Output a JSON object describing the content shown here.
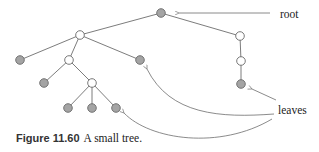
{
  "diagram": {
    "type": "tree",
    "colors": {
      "leaf_fill": "#a4a4a4",
      "internal_fill": "#ffffff",
      "line": "#6d6d6d"
    },
    "nodes": [
      {
        "id": "root",
        "kind": "leaf-colored",
        "role": "root"
      },
      {
        "id": "a",
        "kind": "internal"
      },
      {
        "id": "b",
        "kind": "internal"
      },
      {
        "id": "b2",
        "kind": "internal"
      },
      {
        "id": "b3",
        "kind": "leaf"
      },
      {
        "id": "l1",
        "kind": "leaf"
      },
      {
        "id": "c",
        "kind": "internal"
      },
      {
        "id": "l2",
        "kind": "leaf"
      },
      {
        "id": "l3",
        "kind": "leaf"
      },
      {
        "id": "d",
        "kind": "internal"
      },
      {
        "id": "l4",
        "kind": "leaf"
      },
      {
        "id": "l5",
        "kind": "leaf"
      },
      {
        "id": "l6",
        "kind": "leaf"
      }
    ],
    "edges": [
      [
        "root",
        "a"
      ],
      [
        "root",
        "b"
      ],
      [
        "b",
        "b2"
      ],
      [
        "b2",
        "b3"
      ],
      [
        "a",
        "l1"
      ],
      [
        "a",
        "c"
      ],
      [
        "a",
        "l2"
      ],
      [
        "c",
        "l3"
      ],
      [
        "c",
        "d"
      ],
      [
        "d",
        "l4"
      ],
      [
        "d",
        "l5"
      ],
      [
        "d",
        "l6"
      ]
    ],
    "annotations": {
      "root_label": "root",
      "leaves_label": "leaves"
    }
  },
  "caption": {
    "number": "Figure 11.60",
    "text": "A small tree."
  }
}
